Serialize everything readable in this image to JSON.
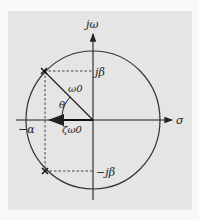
{
  "diagram": {
    "type": "s-plane pole diagram",
    "labels": {
      "imag_axis": "jω",
      "real_axis": "σ",
      "upper_pole_imag": "jβ",
      "lower_pole_imag": "−jβ",
      "real_part": "−α",
      "radius": "ω0",
      "angle": "θ",
      "damping_projection": "ζω0"
    },
    "colors": {
      "panel_bg": "#e5e5e5",
      "page_bg": "#f8f8f8",
      "stroke": "#222222"
    },
    "geometry": {
      "origin": [
        93,
        120
      ],
      "circle_rx": 67,
      "circle_ry": 69,
      "upper_pole": [
        44,
        71
      ],
      "lower_pole": [
        45,
        171
      ]
    }
  }
}
